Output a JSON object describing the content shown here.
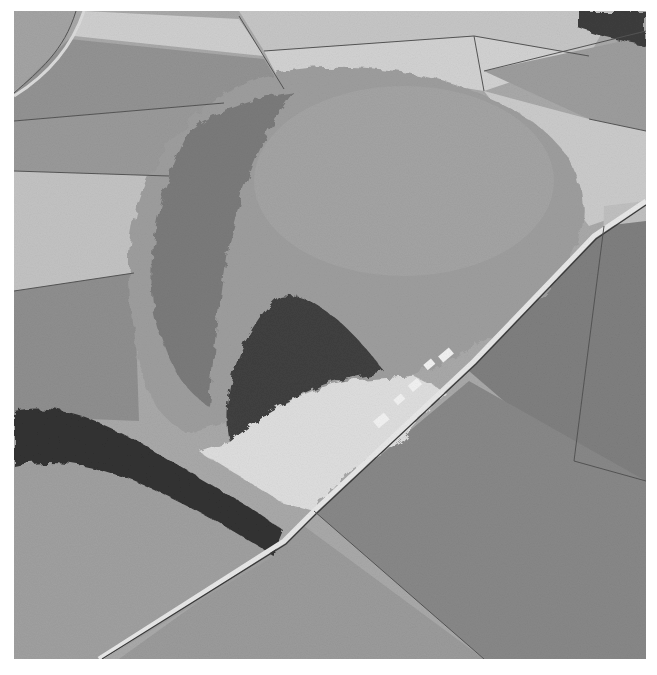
{
  "image": {
    "type": "aerial-photograph",
    "color_mode": "grayscale",
    "subject": "hill with quarry, surrounding fields, road",
    "colors": {
      "background": "#ffffff",
      "field_light": "#c9c9c9",
      "field_mid": "#a8a8a8",
      "field_dark": "#8e8e8e",
      "hill": "#9c9c9c",
      "trees": "#3a3a3a",
      "quarry": "#dcdcdc",
      "road": "#e6e6e6"
    }
  }
}
